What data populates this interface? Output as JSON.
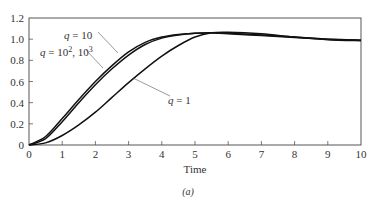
{
  "chart_data": {
    "type": "line",
    "title": "",
    "caption": "(a)",
    "xlabel": "Time",
    "ylabel": "",
    "xlim": [
      0,
      10
    ],
    "ylim": [
      0,
      1.2
    ],
    "grid": false,
    "xticks": [
      0,
      1,
      2,
      3,
      4,
      5,
      6,
      7,
      8,
      9,
      10
    ],
    "yticks": [
      0,
      0.2,
      0.4,
      0.6,
      0.8,
      1.0,
      1.2
    ],
    "ytick_labels": [
      "0",
      "0.2",
      "0.4",
      "0.6",
      "0.8",
      "1.0",
      "1.2"
    ],
    "x": [
      0,
      0.5,
      1,
      1.5,
      2,
      2.5,
      3,
      3.5,
      4,
      4.5,
      5,
      5.5,
      6,
      7,
      8,
      9,
      10
    ],
    "series": [
      {
        "name": "q = 10",
        "values": [
          0,
          0.06,
          0.22,
          0.4,
          0.57,
          0.72,
          0.85,
          0.95,
          1.01,
          1.04,
          1.055,
          1.06,
          1.055,
          1.04,
          1.02,
          1.0,
          0.99
        ]
      },
      {
        "name": "q = 10^2, 10^3",
        "values": [
          0,
          0.08,
          0.25,
          0.43,
          0.6,
          0.75,
          0.88,
          0.97,
          1.02,
          1.045,
          1.055,
          1.06,
          1.05,
          1.035,
          1.015,
          1.0,
          0.99
        ]
      },
      {
        "name": "q = 1",
        "values": [
          0,
          0.02,
          0.09,
          0.19,
          0.31,
          0.45,
          0.59,
          0.72,
          0.84,
          0.94,
          1.02,
          1.06,
          1.065,
          1.05,
          1.02,
          0.995,
          0.985
        ]
      }
    ],
    "annotations": [
      {
        "text": "q = 10",
        "points_to": "q = 10 curve near t=3.7"
      },
      {
        "text": "q = 10², 10³",
        "points_to": "q = 10^2,10^3 curve near t=2.3"
      },
      {
        "text": "q = 1",
        "points_to": "q = 1 curve near t=3.2"
      }
    ]
  },
  "labels": {
    "q10": "q = 10",
    "q100_prefix": "q = 10",
    "q100_sup1": "2",
    "q100_mid": ", 10",
    "q100_sup2": "3",
    "q1": "q = 1",
    "xlabel": "Time",
    "caption": "(a)"
  }
}
